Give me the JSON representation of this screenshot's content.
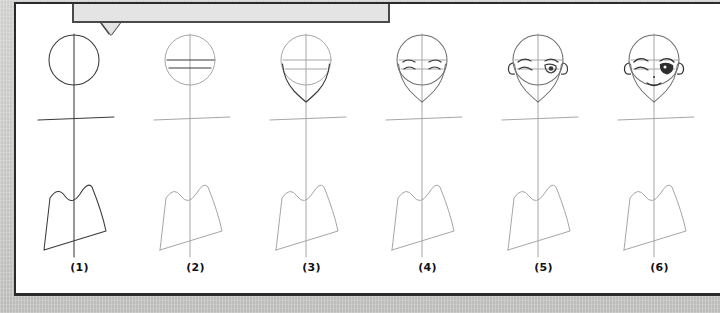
{
  "background": {
    "color": "#c6c6c4",
    "page_color": "#ffffff",
    "page_border_color": "#2b2b2b"
  },
  "callout": {
    "name": "tooltip-balloon",
    "text": "",
    "fill": "#e4e4e4",
    "border": "#4a4a4a"
  },
  "tutorial": {
    "title": "",
    "ink_dark": "#3a3a3a",
    "ink_light": "#9a9a9a",
    "steps": [
      {
        "label": "(1)",
        "description": "circle head with vertical center line and horizontal shoulder line",
        "head_style": "circle",
        "active": true
      },
      {
        "label": "(2)",
        "description": "circle head with eye line and nose line guides",
        "head_style": "circle-guides",
        "active": false
      },
      {
        "label": "(3)",
        "description": "jaw and pointed chin added to form face shape",
        "head_style": "face-outline",
        "active": false
      },
      {
        "label": "(4)",
        "description": "eyebrows and closed eyes sketched on the eye line",
        "head_style": "eyes",
        "active": false
      },
      {
        "label": "(5)",
        "description": "ears added, left eye winking, right eye open with pupil",
        "head_style": "ears-eyes",
        "active": false
      },
      {
        "label": "(6)",
        "description": "nose and smiling mouth added, eye shaded in",
        "head_style": "complete",
        "active": false
      }
    ]
  }
}
